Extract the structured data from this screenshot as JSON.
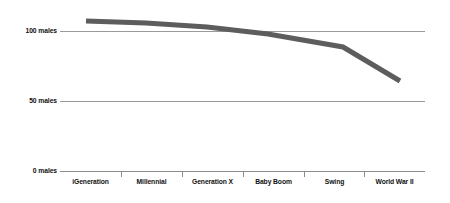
{
  "chart_data": {
    "type": "line",
    "title": "",
    "subtitle": "",
    "xlabel": "",
    "ylabel": "",
    "categories": [
      "iGeneration",
      "Millennial",
      "Generation X",
      "Baby Boom",
      "Swing",
      "World War II"
    ],
    "series": [
      {
        "name": "Males per 100 females",
        "values": [
          107,
          105,
          102,
          97,
          88,
          64
        ]
      }
    ],
    "ylim": [
      0,
      125
    ],
    "yticks": [
      0,
      50,
      100
    ],
    "ytick_labels": [
      "0 males",
      "50 males",
      "100 males"
    ],
    "grid": true,
    "legend": "none",
    "line_color": "#5d5d5d",
    "gridline_color": "#9a9a9a",
    "axis_color": "#8c8c8c",
    "text_color": "#111111"
  },
  "axis": {
    "y": {
      "labels": [
        {
          "text": "100 males",
          "value": 100
        },
        {
          "text": "50 males",
          "value": 50
        },
        {
          "text": "0 males",
          "value": 0
        }
      ]
    },
    "x": {
      "labels": [
        {
          "text": "iGeneration"
        },
        {
          "text": "Millennial"
        },
        {
          "text": "Generation X"
        },
        {
          "text": "Baby Boom"
        },
        {
          "text": "Swing"
        },
        {
          "text": "World War II"
        }
      ]
    }
  }
}
